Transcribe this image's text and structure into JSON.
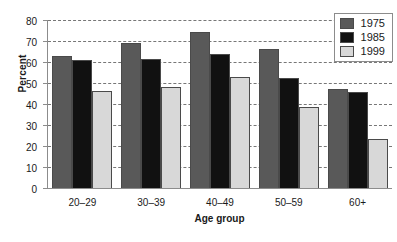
{
  "chart_data": {
    "type": "bar",
    "title": "",
    "xlabel": "Age group",
    "ylabel": "Percent",
    "categories": [
      "20–29",
      "30–39",
      "40–49",
      "50–59",
      "60+"
    ],
    "series": [
      {
        "name": "1975",
        "color": "#595959",
        "values": [
          63,
          69,
          74.5,
          66,
          47
        ]
      },
      {
        "name": "1985",
        "color": "#111111",
        "values": [
          61,
          61.5,
          64,
          52.5,
          45.5
        ]
      },
      {
        "name": "1999",
        "color": "#d8d8d8",
        "values": [
          46,
          48,
          53,
          38.5,
          23.5
        ]
      }
    ],
    "ylim": [
      0,
      80
    ],
    "yticks": [
      0,
      10,
      20,
      30,
      40,
      50,
      60,
      70,
      80
    ],
    "grid": true,
    "legend_position": "top-right"
  }
}
